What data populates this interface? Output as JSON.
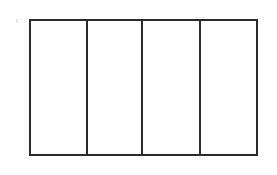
{
  "figure": {
    "name": "four-column-rectangle",
    "background_color": "#fefefe",
    "fill_color": "#ffffff",
    "stroke_color": "#2b2b2b",
    "stroke_width_px": 2,
    "bounds": {
      "x": 29,
      "y": 19,
      "width": 229,
      "height": 137
    },
    "divider_x_positions": [
      86,
      142,
      200
    ],
    "cells": [
      {
        "index": 1,
        "label": "",
        "width_px": 57
      },
      {
        "index": 2,
        "label": "",
        "width_px": 56
      },
      {
        "index": 3,
        "label": "",
        "width_px": 58
      },
      {
        "index": 4,
        "label": "",
        "width_px": 56
      }
    ],
    "artifact": {
      "name": "scan-speck",
      "x": 16,
      "y": 19,
      "color": "#e2e2e2"
    }
  }
}
